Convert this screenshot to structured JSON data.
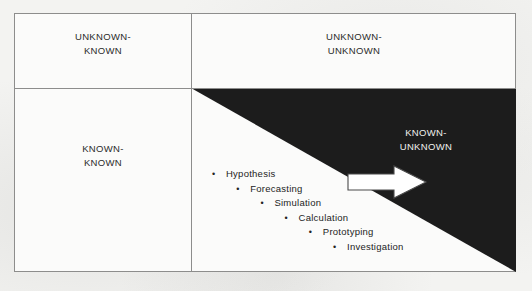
{
  "diagram": {
    "colors": {
      "page_background": "#f3f3f1",
      "panel_background": "#fbfbfa",
      "frame_line": "#8d8d8c",
      "zone_fill": "#1c1c1c",
      "text": "#2b2b2b",
      "inverse_text": "#f0f0ee",
      "arrow_fill": "#ffffff",
      "arrow_outline": "#4a4a4a"
    },
    "quadrants": [
      {
        "id": "unknown-known",
        "label": "UNKNOWN-\nKNOWN",
        "position": "top-left"
      },
      {
        "id": "unknown-unknown",
        "label": "UNKNOWN-\nUNKNOWN",
        "position": "top-right"
      },
      {
        "id": "known-known",
        "label": "KNOWN-\nKNOWN",
        "position": "bottom-left"
      },
      {
        "id": "known-unknown",
        "label": "KNOWN-\nUNKNOWN",
        "position": "bottom-right-shaded"
      }
    ],
    "steps": [
      {
        "bullet": "•",
        "label": "Hypothesis"
      },
      {
        "bullet": "•",
        "label": "Forecasting"
      },
      {
        "bullet": "•",
        "label": "Simulation"
      },
      {
        "bullet": "•",
        "label": "Calculation"
      },
      {
        "bullet": "•",
        "label": "Prototyping"
      },
      {
        "bullet": "•",
        "label": "Investigation"
      }
    ],
    "arrow": {
      "name": "progression-arrow",
      "direction": "right"
    }
  }
}
